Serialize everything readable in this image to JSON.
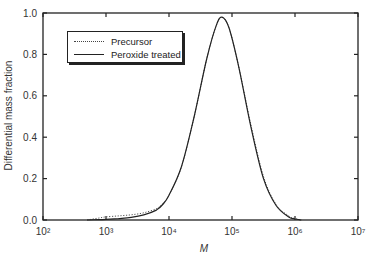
{
  "chart_data": {
    "type": "line",
    "title": "",
    "xlabel": "M",
    "ylabel": "Differential mass fraction",
    "xscale": "log",
    "xlim": [
      100,
      10000000
    ],
    "ylim": [
      0.0,
      1.0
    ],
    "x_ticks": [
      "10²",
      "10³",
      "10⁴",
      "10⁵",
      "10⁶",
      "10⁷"
    ],
    "y_ticks": [
      "0.0",
      "0.2",
      "0.4",
      "0.6",
      "0.8",
      "1.0"
    ],
    "grid": false,
    "legend_position": "upper left",
    "series": [
      {
        "name": "Precursor",
        "style": "dotted",
        "log10_x": [
          2.7,
          2.9,
          3.0,
          3.2,
          3.4,
          3.6,
          3.8,
          3.9,
          4.0,
          4.2,
          4.4,
          4.6,
          4.75,
          4.84,
          4.95,
          5.1,
          5.3,
          5.5,
          5.7,
          5.9,
          6.0,
          6.1
        ],
        "values": [
          0.0,
          0.01,
          0.015,
          0.02,
          0.025,
          0.035,
          0.055,
          0.08,
          0.12,
          0.26,
          0.5,
          0.78,
          0.94,
          0.98,
          0.93,
          0.75,
          0.46,
          0.21,
          0.075,
          0.02,
          0.007,
          0.0
        ]
      },
      {
        "name": "Peroxide treated",
        "style": "solid",
        "log10_x": [
          2.7,
          2.9,
          3.0,
          3.2,
          3.4,
          3.6,
          3.8,
          3.9,
          4.0,
          4.2,
          4.4,
          4.6,
          4.75,
          4.84,
          4.95,
          5.1,
          5.3,
          5.5,
          5.7,
          5.9,
          6.0,
          6.1
        ],
        "values": [
          0.0,
          0.002,
          0.003,
          0.007,
          0.013,
          0.025,
          0.048,
          0.075,
          0.12,
          0.26,
          0.5,
          0.78,
          0.94,
          0.98,
          0.93,
          0.75,
          0.45,
          0.2,
          0.07,
          0.015,
          0.005,
          0.0
        ]
      }
    ]
  }
}
